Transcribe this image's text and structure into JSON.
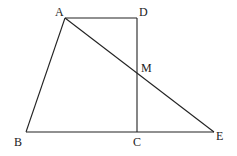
{
  "diagram": {
    "type": "geometry",
    "stroke_color": "#222222",
    "background": "#ffffff",
    "points": {
      "A": {
        "label": "A",
        "x": 65,
        "y": 18
      },
      "D": {
        "label": "D",
        "x": 137,
        "y": 18
      },
      "M": {
        "label": "M",
        "x": 137,
        "y": 73
      },
      "B": {
        "label": "B",
        "x": 26,
        "y": 132
      },
      "C": {
        "label": "C",
        "x": 137,
        "y": 132
      },
      "E": {
        "label": "E",
        "x": 214,
        "y": 132
      }
    },
    "segments": [
      [
        "A",
        "D"
      ],
      [
        "D",
        "C"
      ],
      [
        "A",
        "B"
      ],
      [
        "B",
        "E"
      ],
      [
        "A",
        "E"
      ]
    ],
    "labels": {
      "A": "A",
      "D": "D",
      "M": "M",
      "B": "B",
      "C": "C",
      "E": "E"
    }
  }
}
